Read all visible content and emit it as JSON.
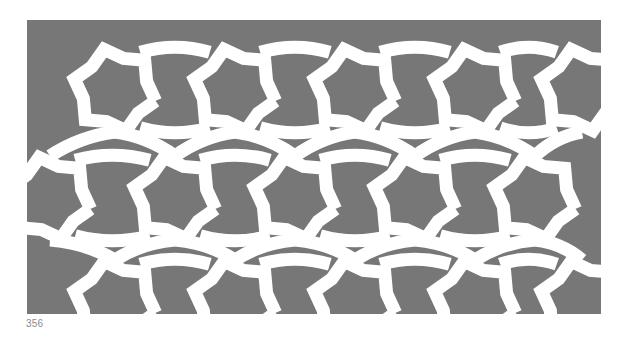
{
  "figure": {
    "type": "geometric interlace ornament",
    "motif": "six-pointed-star",
    "background_color": "#ffffff",
    "field_color": "#777777",
    "band_color": "#ffffff",
    "star_rows": [
      {
        "y": 70,
        "x": [
          88,
          208,
          328,
          448,
          555
        ]
      },
      {
        "y": 178,
        "x": [
          23,
          148,
          268,
          388,
          508
        ]
      },
      {
        "y": 282,
        "x": [
          88,
          208,
          328,
          448,
          555
        ]
      }
    ],
    "band_width": 13
  },
  "page": {
    "number": "356"
  }
}
